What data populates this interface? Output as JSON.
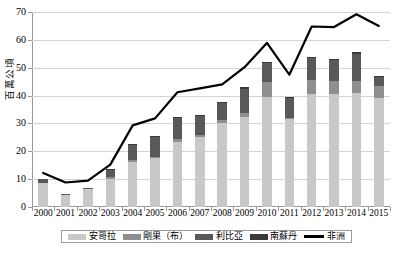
{
  "chart_data": {
    "type": "bar",
    "title": "",
    "subtitle": "",
    "xlabel": "",
    "ylabel": "百萬公頃",
    "ylim": [
      0,
      70
    ],
    "ytick_step": 10,
    "yticks": [
      "0",
      "10",
      "20",
      "30",
      "40",
      "50",
      "60",
      "70"
    ],
    "grid": true,
    "legend_position": "bottom",
    "stacked": true,
    "categories": [
      "2000",
      "2001",
      "2002",
      "2003",
      "2004",
      "2005",
      "2006",
      "2007",
      "2008",
      "2009",
      "2010",
      "2011",
      "2012",
      "2013",
      "2014",
      "2015"
    ],
    "series": [
      {
        "name": "安哥拉",
        "kind": "bar",
        "color": "#c8c8c8",
        "values": [
          8.6,
          4.4,
          6.4,
          10.0,
          16.2,
          17.5,
          23.4,
          25.0,
          30.3,
          32.4,
          39.6,
          31.5,
          40.6,
          40.4,
          40.8,
          39.2
        ]
      },
      {
        "name": "剛果（布）",
        "kind": "bar",
        "color": "#8f8f8f",
        "values": [
          0.0,
          0.0,
          0.0,
          0.6,
          0.5,
          0.6,
          0.9,
          0.8,
          0.8,
          1.2,
          5.2,
          0.6,
          4.9,
          4.7,
          4.3,
          4.1
        ]
      },
      {
        "name": "利比亞",
        "kind": "bar",
        "color": "#595959",
        "values": [
          1.5,
          0.3,
          0.3,
          2.9,
          5.4,
          7.0,
          7.8,
          7.0,
          6.2,
          8.9,
          7.0,
          7.3,
          7.9,
          7.6,
          9.9,
          3.5
        ]
      },
      {
        "name": "南蘇丹",
        "kind": "bar",
        "color": "#3a3a3a",
        "values": [
          0.0,
          0.0,
          0.0,
          0.3,
          0.4,
          0.3,
          0.3,
          0.2,
          0.4,
          0.4,
          0.4,
          0.2,
          0.5,
          0.6,
          0.6,
          0.4
        ]
      },
      {
        "name": "非洲",
        "kind": "line",
        "color": "#000000",
        "values": [
          12.2,
          8.8,
          9.5,
          15.2,
          29.3,
          31.8,
          41.2,
          42.6,
          44.0,
          50.2,
          58.9,
          47.5,
          64.8,
          64.6,
          69.2,
          65.0
        ]
      }
    ]
  },
  "axis": {
    "y_title": "百萬公頃"
  },
  "legend": {
    "items": [
      {
        "label": "安哥拉",
        "marker": "swatch",
        "color": "#c8c8c8"
      },
      {
        "label": "剛果（布）",
        "marker": "swatch",
        "color": "#8f8f8f"
      },
      {
        "label": "利比亞",
        "marker": "swatch",
        "color": "#595959"
      },
      {
        "label": "南蘇丹",
        "marker": "swatch",
        "color": "#3a3a3a"
      },
      {
        "label": "非洲",
        "marker": "line",
        "color": "#000000"
      }
    ]
  }
}
